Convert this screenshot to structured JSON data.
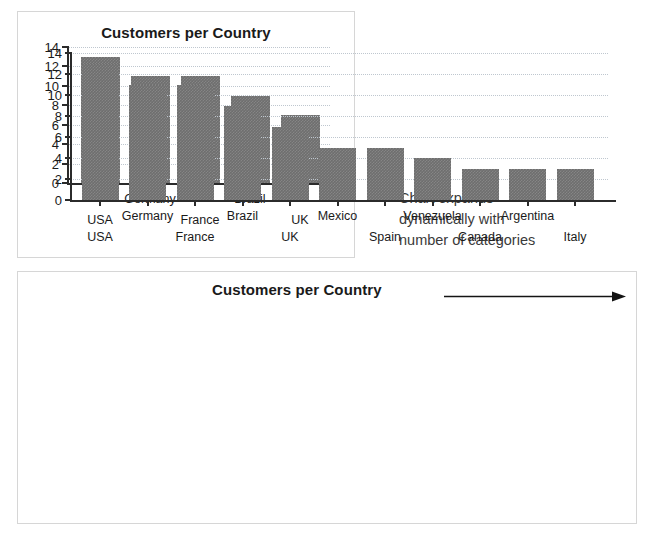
{
  "annotation": {
    "line1": "Chart expands",
    "line2": "dynamically with",
    "line3": "number of categories"
  },
  "colors": {
    "bar": "#6e6e6e",
    "axis": "#2b2b2b",
    "gridline": "#bfc7cf",
    "panel_border": "#d6d6d6",
    "text": "#1a1a1a"
  },
  "chart_data": [
    {
      "id": "small",
      "type": "bar",
      "title": "Customers per Country",
      "xlabel": "",
      "ylabel": "",
      "ylim": [
        0,
        14
      ],
      "yticks": [
        0,
        2,
        4,
        6,
        8,
        10,
        12,
        14
      ],
      "grid": true,
      "legend": "none",
      "categories": [
        "USA",
        "Germany",
        "France",
        "Brazil",
        "UK"
      ],
      "values": [
        13,
        11,
        11,
        9,
        7
      ]
    },
    {
      "id": "large",
      "type": "bar",
      "title": "Customers per Country",
      "title_annotation_icon": "right-arrow",
      "xlabel": "",
      "ylabel": "",
      "ylim": [
        0,
        14
      ],
      "yticks": [
        0,
        2,
        4,
        6,
        8,
        10,
        12,
        14
      ],
      "grid": true,
      "legend": "none",
      "categories": [
        "USA",
        "Germany",
        "France",
        "Brazil",
        "UK",
        "Mexico",
        "Spain",
        "Venezuela",
        "Canada",
        "Argentina",
        "Italy"
      ],
      "values": [
        13,
        11,
        11,
        9,
        7,
        5,
        5,
        4,
        3,
        3,
        3
      ]
    }
  ]
}
